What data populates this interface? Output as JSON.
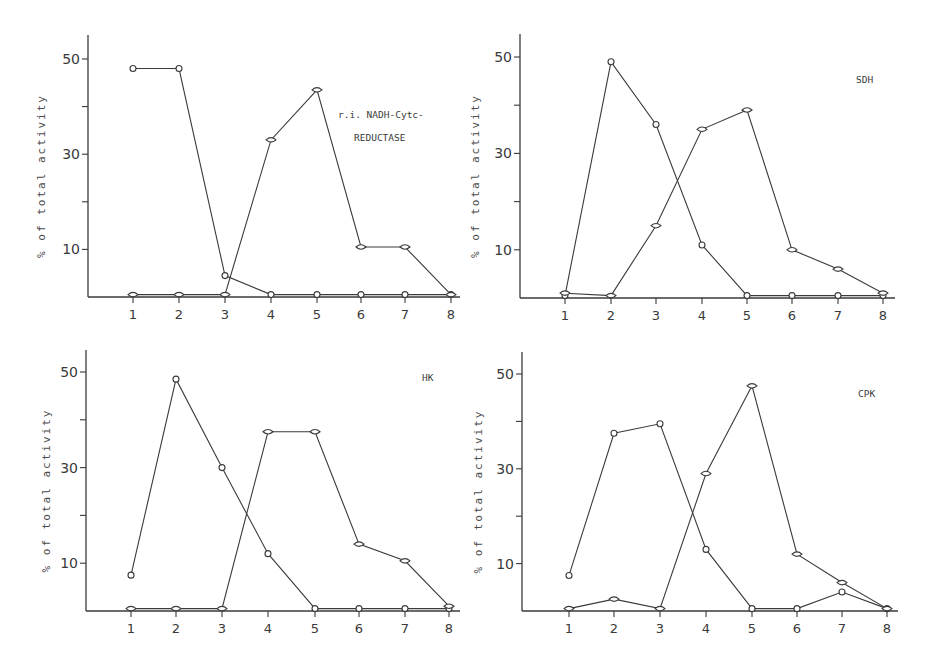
{
  "chart_data": [
    {
      "type": "line",
      "panel": "top-left",
      "title": "r.i. NADH-Cytc-REDUCTASE",
      "annotation_lines": [
        "r.i. NADH-Cytc-",
        "REDUCTASE"
      ],
      "xlabel": "",
      "ylabel": "% of total activity",
      "x": [
        1,
        2,
        3,
        4,
        5,
        6,
        7,
        8
      ],
      "yticks": [
        10,
        30,
        50
      ],
      "ylim": [
        0,
        55
      ],
      "grid": false,
      "series": [
        {
          "name": "circle-markers",
          "marker": "circle",
          "values": [
            48,
            48,
            4.5,
            0.5,
            0.5,
            0.5,
            0.5,
            0.5
          ]
        },
        {
          "name": "diamond-markers",
          "marker": "diamond",
          "values": [
            0.5,
            0.5,
            0.5,
            33,
            43.5,
            10.5,
            10.5,
            0.5
          ]
        }
      ]
    },
    {
      "type": "line",
      "panel": "top-right",
      "title": "SDH",
      "annotation_lines": [
        "SDH"
      ],
      "xlabel": "",
      "ylabel": "% of total activity",
      "x": [
        1,
        2,
        3,
        4,
        5,
        6,
        7,
        8
      ],
      "yticks": [
        10,
        30,
        50
      ],
      "ylim": [
        0,
        55
      ],
      "grid": false,
      "series": [
        {
          "name": "circle-markers",
          "marker": "circle",
          "values": [
            0.5,
            49,
            36,
            11,
            0.5,
            0.5,
            0.5,
            0.5
          ]
        },
        {
          "name": "diamond-markers",
          "marker": "diamond",
          "values": [
            1,
            0.5,
            15,
            35,
            39,
            10,
            6,
            1
          ]
        }
      ]
    },
    {
      "type": "line",
      "panel": "bottom-left",
      "title": "HK",
      "annotation_lines": [
        "HK"
      ],
      "xlabel": "",
      "ylabel": "% of total activity",
      "x": [
        1,
        2,
        3,
        4,
        5,
        6,
        7,
        8
      ],
      "yticks": [
        10,
        30,
        50
      ],
      "ylim": [
        0,
        55
      ],
      "grid": false,
      "series": [
        {
          "name": "circle-markers",
          "marker": "circle",
          "values": [
            7.5,
            48.5,
            30,
            12,
            0.5,
            0.5,
            0.5,
            0.5
          ]
        },
        {
          "name": "diamond-markers",
          "marker": "diamond",
          "values": [
            0.5,
            0.5,
            0.5,
            37.5,
            37.5,
            14,
            10.5,
            1
          ]
        }
      ]
    },
    {
      "type": "line",
      "panel": "bottom-right",
      "title": "CPK",
      "annotation_lines": [
        "CPK"
      ],
      "xlabel": "",
      "ylabel": "% of total activity",
      "x": [
        1,
        2,
        3,
        4,
        5,
        6,
        7,
        8
      ],
      "yticks": [
        10,
        30,
        50
      ],
      "ylim": [
        0,
        55
      ],
      "grid": false,
      "series": [
        {
          "name": "circle-markers",
          "marker": "circle",
          "values": [
            7.5,
            37.5,
            39.5,
            13,
            0.5,
            0.5,
            4,
            0.5
          ]
        },
        {
          "name": "diamond-markers",
          "marker": "diamond",
          "values": [
            0.5,
            2.5,
            0.5,
            29,
            47.5,
            12,
            6,
            0.5
          ]
        }
      ]
    }
  ],
  "panels_layout": [
    {
      "x0": 88,
      "base": 297,
      "y50": 59,
      "xpos": [
        133,
        179,
        225,
        271,
        317,
        361,
        405,
        451
      ],
      "axisTop": 35,
      "axisRight": 460,
      "ann": [
        [
          338,
          118
        ],
        [
          354,
          141
        ]
      ],
      "ylabelX": 45
    },
    {
      "x0": 520,
      "base": 298,
      "y50": 57,
      "xpos": [
        565,
        611,
        656,
        702,
        747,
        792,
        838,
        883
      ],
      "axisTop": 34,
      "axisRight": 895,
      "ann": [
        [
          856,
          83
        ]
      ],
      "ylabelX": 479
    },
    {
      "x0": 86,
      "base": 611,
      "y50": 372,
      "xpos": [
        131,
        176,
        222,
        268,
        315,
        359,
        405,
        449
      ],
      "axisTop": 350,
      "axisRight": 460,
      "ann": [
        [
          422,
          381
        ]
      ],
      "ylabelX": 50
    },
    {
      "x0": 522,
      "base": 611,
      "y50": 374,
      "xpos": [
        569,
        614,
        660,
        706,
        752,
        797,
        842,
        887
      ],
      "axisTop": 352,
      "axisRight": 898,
      "ann": [
        [
          858,
          397
        ]
      ],
      "ylabelX": 482
    }
  ]
}
